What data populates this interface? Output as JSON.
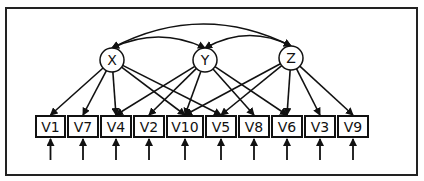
{
  "diagram": {
    "type": "path-diagram",
    "latent": [
      {
        "id": "X",
        "label": "X",
        "cx": 112,
        "cy": 60
      },
      {
        "id": "Y",
        "label": "Y",
        "cx": 205,
        "cy": 60
      },
      {
        "id": "Z",
        "label": "Z",
        "cx": 291,
        "cy": 58
      }
    ],
    "observed": [
      {
        "id": "V1",
        "label": "V1",
        "x": 36,
        "w": 29
      },
      {
        "id": "V7",
        "label": "V7",
        "x": 68,
        "w": 30
      },
      {
        "id": "V4",
        "label": "V4",
        "x": 101,
        "w": 30
      },
      {
        "id": "V2",
        "label": "V2",
        "x": 134,
        "w": 30
      },
      {
        "id": "V10",
        "label": "V10",
        "x": 167,
        "w": 36
      },
      {
        "id": "V5",
        "label": "V5",
        "x": 206,
        "w": 30
      },
      {
        "id": "V8",
        "label": "V8",
        "x": 239,
        "w": 30
      },
      {
        "id": "V6",
        "label": "V6",
        "x": 272,
        "w": 30
      },
      {
        "id": "V3",
        "label": "V3",
        "x": 305,
        "w": 30
      },
      {
        "id": "V9",
        "label": "V9",
        "x": 338,
        "w": 30
      }
    ],
    "loadings": [
      [
        "X",
        "V1"
      ],
      [
        "X",
        "V7"
      ],
      [
        "X",
        "V4"
      ],
      [
        "X",
        "V10"
      ],
      [
        "X",
        "V5"
      ],
      [
        "Y",
        "V4"
      ],
      [
        "Y",
        "V2"
      ],
      [
        "Y",
        "V10"
      ],
      [
        "Y",
        "V8"
      ],
      [
        "Y",
        "V6"
      ],
      [
        "Z",
        "V10"
      ],
      [
        "Z",
        "V5"
      ],
      [
        "Z",
        "V6"
      ],
      [
        "Z",
        "V3"
      ],
      [
        "Z",
        "V9"
      ]
    ],
    "covariances": [
      [
        "X",
        "Y"
      ],
      [
        "Y",
        "Z"
      ],
      [
        "X",
        "Z"
      ]
    ],
    "error_terms": [
      "V1",
      "V7",
      "V4",
      "V2",
      "V10",
      "V5",
      "V8",
      "V6",
      "V3",
      "V9"
    ]
  }
}
